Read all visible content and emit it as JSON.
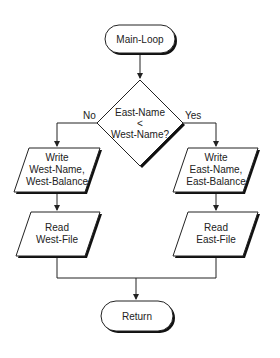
{
  "diagram": {
    "type": "flowchart",
    "nodes": {
      "start": {
        "shape": "terminator",
        "label": "Main-Loop"
      },
      "decision": {
        "shape": "decision",
        "lines": [
          "East-Name",
          "<",
          "West-Name?"
        ]
      },
      "write_west": {
        "shape": "io",
        "lines": [
          "Write",
          "West-Name,",
          "West-Balance"
        ]
      },
      "read_west": {
        "shape": "io",
        "lines": [
          "Read",
          "West-File"
        ]
      },
      "write_east": {
        "shape": "io",
        "lines": [
          "Write",
          "East-Name,",
          "East-Balance"
        ]
      },
      "read_east": {
        "shape": "io",
        "lines": [
          "Read",
          "East-File"
        ]
      },
      "end": {
        "shape": "terminator",
        "label": "Return"
      }
    },
    "edges": {
      "no_label": "No",
      "yes_label": "Yes"
    },
    "colors": {
      "stroke": "#222222",
      "shadow": "#111111",
      "fill": "#ffffff"
    }
  }
}
